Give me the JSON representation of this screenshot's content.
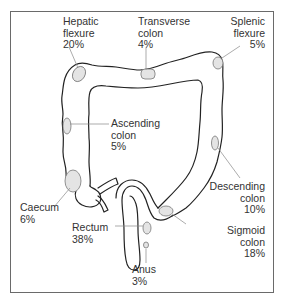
{
  "diagram": {
    "colors": {
      "outline": "#222222",
      "site_fill": "#e4e4e4",
      "site_stroke": "#777777",
      "leader": "#888888",
      "text": "#333333",
      "frame": "#6a6a6a"
    },
    "labels": [
      {
        "id": "hepatic-flexure",
        "name_line1": "Hepatic",
        "name_line2": "flexure",
        "percent": "20%"
      },
      {
        "id": "transverse-colon",
        "name_line1": "Transverse",
        "name_line2": "colon",
        "percent": "4%"
      },
      {
        "id": "splenic-flexure",
        "name_line1": "Splenic",
        "name_line2": "flexure",
        "percent": "5%"
      },
      {
        "id": "ascending-colon",
        "name_line1": "Ascending",
        "name_line2": "colon",
        "percent": "5%"
      },
      {
        "id": "descending-colon",
        "name_line1": "Descending",
        "name_line2": "colon",
        "percent": "10%"
      },
      {
        "id": "caecum",
        "name_line1": "Caecum",
        "percent": "6%"
      },
      {
        "id": "rectum",
        "name_line1": "Rectum",
        "percent": "38%"
      },
      {
        "id": "sigmoid-colon",
        "name_line1": "Sigmoid",
        "name_line2": "colon",
        "percent": "18%"
      },
      {
        "id": "anus",
        "name_line1": "Anus",
        "percent": "3%"
      }
    ]
  }
}
